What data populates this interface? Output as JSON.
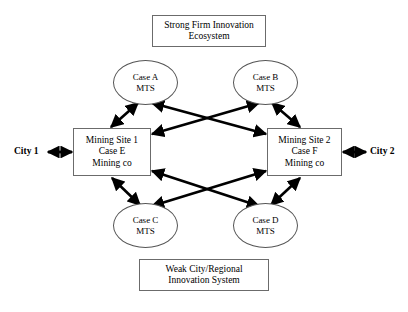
{
  "diagram": {
    "title_top": {
      "line1": "Strong Firm Innovation",
      "line2": "Ecosystem"
    },
    "title_bottom": {
      "line1": "Weak City/Regional",
      "line2": "Innovation System"
    },
    "sites": [
      {
        "id": "mining-site-1",
        "line1": "Mining Site 1",
        "line2": "Case E",
        "line3": "Mining co"
      },
      {
        "id": "mining-site-2",
        "line1": "Mining Site 2",
        "line2": "Case F",
        "line3": "Mining co"
      }
    ],
    "mts_nodes": [
      {
        "id": "case-a",
        "line1": "Case A",
        "line2": "MTS"
      },
      {
        "id": "case-b",
        "line1": "Case B",
        "line2": "MTS"
      },
      {
        "id": "case-c",
        "line1": "Case C",
        "line2": "MTS"
      },
      {
        "id": "case-d",
        "line1": "Case D",
        "line2": "MTS"
      }
    ],
    "cities": [
      {
        "id": "city-1",
        "label": "City 1"
      },
      {
        "id": "city-2",
        "label": "City 2"
      }
    ],
    "colors": {
      "line": "#000000",
      "box_border": "#6b6b6b",
      "ellipse_border": "#555555",
      "background": "#ffffff",
      "text": "#000000"
    },
    "connectors": {
      "type": "double-headed-arrow",
      "description": "Each MTS node links to both mining sites; links cross in the centre. Cities link laterally to the adjacent mining site."
    }
  }
}
